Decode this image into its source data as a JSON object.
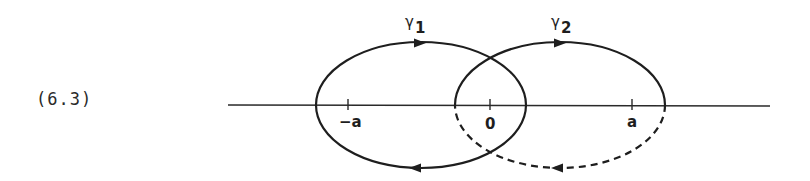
{
  "equation_number": "(6.3)",
  "axis": {
    "ticks": [
      {
        "label": "−a",
        "value": -1
      },
      {
        "label": "0",
        "value": 0
      },
      {
        "label": "a",
        "value": 1
      }
    ]
  },
  "curves": [
    {
      "id": "gamma1",
      "symbol": "γ",
      "subscript": "1",
      "center": -0.5,
      "half_width": 0.74,
      "lower_half_style": "solid",
      "orientation": "clockwise"
    },
    {
      "id": "gamma2",
      "symbol": "γ",
      "subscript": "2",
      "center": 0.5,
      "half_width": 0.74,
      "lower_half_style": "dashed",
      "orientation": "clockwise"
    }
  ]
}
